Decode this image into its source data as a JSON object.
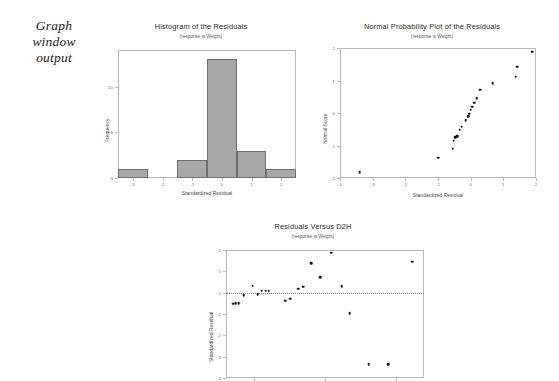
{
  "caption": {
    "line1": "Graph",
    "line2": "window",
    "line3": "output"
  },
  "chart_data": [
    {
      "id": "histogram",
      "type": "bar",
      "title": "Histogram of the Residuals",
      "subtitle": "(response is Weight)",
      "xlabel": "Standardized Residual",
      "ylabel": "Frequency",
      "xlim": [
        -3.5,
        2.5
      ],
      "ylim": [
        0,
        14
      ],
      "xticks": [
        -3,
        -2,
        -1,
        0,
        1,
        2
      ],
      "xticklabels": [
        "-3",
        "-2",
        "-1",
        "0",
        "1",
        "2"
      ],
      "yticks": [
        0,
        5,
        10
      ],
      "yticklabels": [
        "0",
        "5",
        "10"
      ],
      "grid": false,
      "bin_edges": [
        -3.5,
        -2.5,
        -1.5,
        -0.5,
        0.5,
        1.5,
        2.5
      ],
      "categories": [
        "-3.5 to -2.5",
        "-2.5 to -1.5",
        "-1.5 to -0.5",
        "-0.5 to 0.5",
        "0.5 to 1.5",
        "1.5 to 2.5"
      ],
      "values": [
        1,
        0,
        2,
        13,
        3,
        1
      ]
    },
    {
      "id": "normal-probability-plot",
      "type": "scatter",
      "title": "Normal Probability Plot of the Residuals",
      "subtitle": "(response is Weight)",
      "xlabel": "Standardized Residual",
      "ylabel": "Normal Score",
      "xlim": [
        -4,
        2
      ],
      "ylim": [
        -2,
        2
      ],
      "xticks": [
        -4,
        -3,
        -2,
        -1,
        0,
        1,
        2
      ],
      "xticklabels": [
        "-4",
        "-3",
        "-2",
        "-1",
        "0",
        "1",
        "2"
      ],
      "yticks": [
        -2,
        -1,
        0,
        1,
        2
      ],
      "yticklabels": [
        "-2",
        "-1",
        "0",
        "1",
        "2"
      ],
      "grid": false,
      "x": [
        -3.4,
        -1.0,
        -0.55,
        -0.52,
        -0.47,
        -0.42,
        -0.34,
        -0.27,
        -0.15,
        -0.08,
        -0.04,
        0.0,
        0.05,
        0.1,
        0.18,
        0.3,
        0.68,
        1.38,
        1.42,
        1.88
      ],
      "y": [
        -1.82,
        -1.38,
        -1.1,
        -0.85,
        -0.75,
        -0.72,
        -0.52,
        -0.42,
        -0.22,
        -0.1,
        -0.02,
        0.1,
        0.2,
        0.32,
        0.45,
        0.72,
        0.92,
        1.12,
        1.42,
        1.88
      ]
    },
    {
      "id": "residuals-versus-d2h",
      "type": "scatter",
      "title": "Residuals Versus D2H",
      "subtitle": "(response is Weight)",
      "xlabel": "",
      "ylabel": "Standardized Residual",
      "xlim": [
        0,
        100
      ],
      "ylim": [
        -4,
        2
      ],
      "xticks": [
        14,
        50,
        86
      ],
      "xticklabels": [
        "",
        "",
        ""
      ],
      "yticks": [
        -4,
        -3,
        -2,
        -1,
        0,
        1,
        2
      ],
      "yticklabels": [
        "-4",
        "-3",
        "-2",
        "-1",
        "0",
        "1",
        "2"
      ],
      "grid": false,
      "reference_line": 0,
      "x": [
        3.5,
        5.0,
        6.5,
        9.0,
        13.5,
        16.0,
        18.0,
        20.0,
        21.5,
        30.0,
        32.5,
        36.5,
        39.0,
        43.0,
        47.5,
        53.0,
        58.5,
        62.5,
        72.0,
        82.0,
        94.0
      ],
      "y": [
        -0.52,
        -0.5,
        -0.48,
        -0.12,
        0.33,
        -0.08,
        0.1,
        0.09,
        0.1,
        -0.38,
        -0.28,
        0.18,
        0.28,
        1.38,
        0.72,
        1.88,
        0.3,
        -0.95,
        -3.35,
        -3.35,
        1.45
      ]
    }
  ]
}
